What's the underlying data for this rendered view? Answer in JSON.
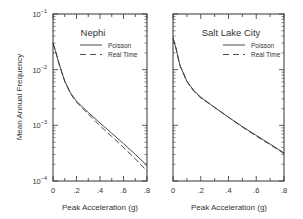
{
  "figure": {
    "ylabel": "Mean Annual Frequency",
    "xlabel": "Peak Acceleration (g)",
    "y_tick_labels": [
      {
        "base": "10",
        "exp": "−1"
      },
      {
        "base": "10",
        "exp": "−2"
      },
      {
        "base": "10",
        "exp": "−3"
      },
      {
        "base": "10",
        "exp": "−4"
      }
    ],
    "x_tick_labels": [
      "0",
      ".2",
      ".4",
      ".6",
      ".8"
    ]
  },
  "chart_data": [
    {
      "type": "line",
      "title": "Nephi",
      "xlabel": "Peak Acceleration (g)",
      "ylabel": "Mean Annual Frequency",
      "xlim": [
        0,
        0.8
      ],
      "ylim": [
        0.0001,
        0.1
      ],
      "yscale": "log",
      "legend": [
        "Poisson",
        "Real Time"
      ],
      "legend_position": "upper right",
      "x": [
        0,
        0.02,
        0.05,
        0.1,
        0.15,
        0.2,
        0.3,
        0.4,
        0.5,
        0.6,
        0.7,
        0.8
      ],
      "series": [
        {
          "name": "Poisson",
          "style": "solid",
          "values": [
            0.03,
            0.022,
            0.013,
            0.0062,
            0.0038,
            0.0027,
            0.0017,
            0.0011,
            0.00072,
            0.00047,
            0.0003,
            0.00019
          ]
        },
        {
          "name": "Real Time",
          "style": "dashed",
          "values": [
            0.03,
            0.022,
            0.013,
            0.0061,
            0.0037,
            0.0026,
            0.0016,
            0.00098,
            0.00063,
            0.0004,
            0.00025,
            0.00015
          ]
        }
      ]
    },
    {
      "type": "line",
      "title": "Salt Lake City",
      "xlabel": "Peak Acceleration (g)",
      "ylabel": "Mean Annual Frequency",
      "xlim": [
        0,
        0.8
      ],
      "ylim": [
        0.0001,
        0.1
      ],
      "yscale": "log",
      "legend": [
        "Poisson",
        "Real Time"
      ],
      "legend_position": "upper right",
      "x": [
        0,
        0.02,
        0.05,
        0.1,
        0.15,
        0.2,
        0.3,
        0.4,
        0.5,
        0.6,
        0.7,
        0.8
      ],
      "series": [
        {
          "name": "Poisson",
          "style": "solid",
          "values": [
            0.037,
            0.025,
            0.012,
            0.0062,
            0.0042,
            0.0032,
            0.0021,
            0.0014,
            0.00095,
            0.00066,
            0.00046,
            0.00032
          ]
        },
        {
          "name": "Real Time",
          "style": "dashed",
          "values": [
            0.037,
            0.025,
            0.012,
            0.0061,
            0.0041,
            0.0031,
            0.0021,
            0.0014,
            0.00093,
            0.00064,
            0.00045,
            0.00031
          ]
        }
      ]
    }
  ]
}
